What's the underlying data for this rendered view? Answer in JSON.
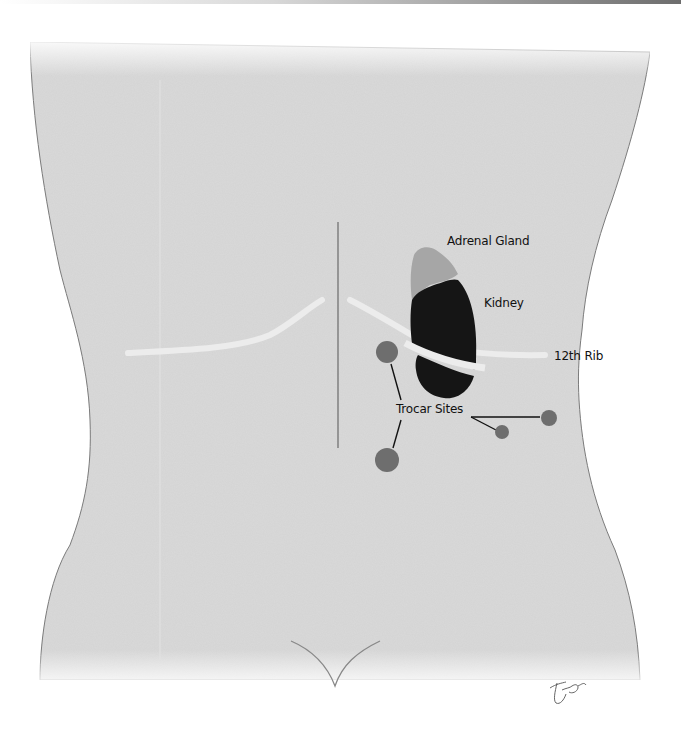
{
  "figure": {
    "type": "anatomical illustration",
    "view": "posterior torso (back)",
    "colors": {
      "background": "#ffffff",
      "skin": "#dadada",
      "outline": "#7a7a7a",
      "kidney": "#151515",
      "adrenal_gland": "#a6a6a6",
      "trocar_site": "#6e6e6e",
      "rib": "#ececec",
      "leader_line": "#111111"
    }
  },
  "labels": {
    "adrenal_gland": "Adrenal Gland",
    "kidney": "Kidney",
    "rib": "12th Rib",
    "trocar_sites": "Trocar Sites"
  },
  "trocar_sites": [
    {
      "id": 1,
      "cx": 387,
      "cy": 352,
      "r": 11
    },
    {
      "id": 2,
      "cx": 387,
      "cy": 460,
      "r": 12
    },
    {
      "id": 3,
      "cx": 502,
      "cy": 432,
      "r": 7
    },
    {
      "id": 4,
      "cx": 549,
      "cy": 418,
      "r": 8
    }
  ],
  "signature": "artist signature (illegible)"
}
